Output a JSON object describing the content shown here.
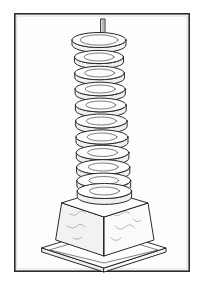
{
  "figure": {
    "title": "Stacked disc insulator on tapered wooden base",
    "kind": "line-art-illustration",
    "caption": "",
    "colors": {
      "ink": "#1f1f1f",
      "frame": "#2b2b2b",
      "page_background": "#ffffff",
      "panel_background": "#fdfdfc",
      "grain": "#8a8a88",
      "face_light": "#fbfbfa",
      "face_mid": "#f2f2f0"
    }
  },
  "frame": {
    "name": "panel-border",
    "x": 14,
    "y": 13,
    "width": 176,
    "height": 259,
    "stroke_width": 1.6
  },
  "finial": {
    "name": "top-rod",
    "label": "rod",
    "x": 103,
    "top_y": 19,
    "bottom_y": 35,
    "width": 4
  },
  "cap": {
    "name": "top-cap-disc",
    "label": "cap",
    "center_x": 99,
    "center_y": 42,
    "rx": 27,
    "ry": 7.5,
    "thickness": 5
  },
  "column": {
    "name": "central-column",
    "label": "column",
    "top_y": 44,
    "bottom_y": 196,
    "top_half_width": 14,
    "bottom_half_width": 16,
    "center_x_top": 99,
    "center_x_bottom": 104
  },
  "discs": {
    "name": "insulator-disc-stack",
    "count": 10,
    "label": "discs",
    "items": [
      {
        "index": 1,
        "center_x": 99,
        "center_y": 57,
        "rx": 24.5,
        "ry": 6.6,
        "thickness": 5.0
      },
      {
        "index": 2,
        "center_x": 99.6,
        "center_y": 73,
        "rx": 24.8,
        "ry": 6.7,
        "thickness": 5.1
      },
      {
        "index": 3,
        "center_x": 100.2,
        "center_y": 89,
        "rx": 25.1,
        "ry": 6.8,
        "thickness": 5.2
      },
      {
        "index": 4,
        "center_x": 100.8,
        "center_y": 105,
        "rx": 25.4,
        "ry": 6.9,
        "thickness": 5.3
      },
      {
        "index": 5,
        "center_x": 101.4,
        "center_y": 121,
        "rx": 25.7,
        "ry": 7.0,
        "thickness": 5.4
      },
      {
        "index": 6,
        "center_x": 102.0,
        "center_y": 137,
        "rx": 26.0,
        "ry": 7.1,
        "thickness": 5.5
      },
      {
        "index": 7,
        "center_x": 102.6,
        "center_y": 152.5,
        "rx": 26.3,
        "ry": 7.2,
        "thickness": 5.6
      },
      {
        "index": 8,
        "center_x": 103.2,
        "center_y": 167,
        "rx": 26.6,
        "ry": 7.3,
        "thickness": 5.7
      },
      {
        "index": 9,
        "center_x": 103.8,
        "center_y": 180.5,
        "rx": 26.9,
        "ry": 7.4,
        "thickness": 5.8
      },
      {
        "index": 10,
        "center_x": 104.4,
        "center_y": 192,
        "rx": 27.2,
        "ry": 7.5,
        "thickness": 5.9
      }
    ]
  },
  "plinth": {
    "name": "wooden-base-block",
    "label": "base",
    "top_face": {
      "back": [
        104,
        190
      ],
      "right": [
        148,
        203
      ],
      "front": [
        104,
        217
      ],
      "left": [
        62,
        203
      ]
    },
    "left_face": {
      "width": 42,
      "height": 52
    },
    "right_face": {
      "width": 44,
      "height": 50
    },
    "front_corner_y": 256,
    "grain_marks": 7
  },
  "baseplate": {
    "name": "base-plate",
    "label": "plate",
    "back": [
      104,
      229
    ],
    "right": [
      166,
      248
    ],
    "front": [
      104,
      268
    ],
    "left": [
      42,
      248
    ],
    "thickness": 4
  }
}
